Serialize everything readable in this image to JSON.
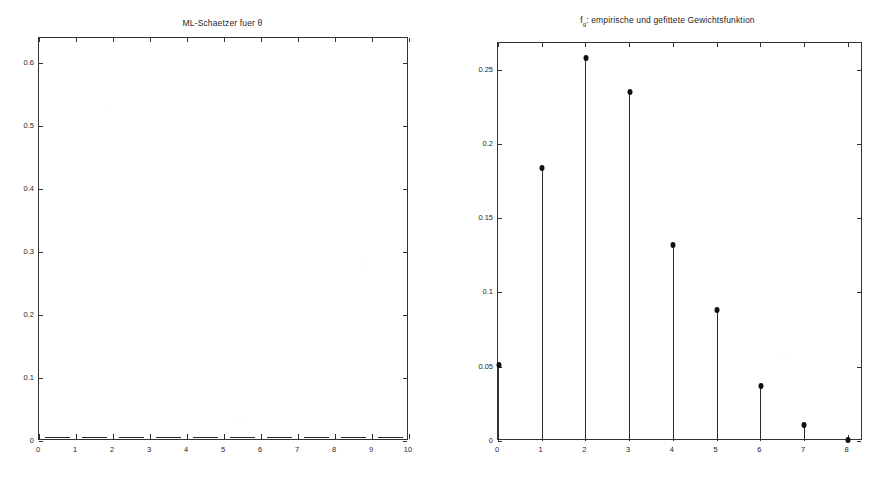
{
  "page": {
    "background_color": "#ffffff",
    "ink_color": "#1f1f1f",
    "axis_color": "#333333"
  },
  "charts": [
    {
      "id": "ml-estimator",
      "title_main": "ML-Schaetzer fuer ",
      "title_symbol": "θ",
      "title_full": "ML-Schaetzer fuer θ"
    },
    {
      "id": "weight-function",
      "title_prefix": "f",
      "title_subscript": "g",
      "title_rest": ": empirische und gefittete Gewichtsfunktion",
      "title_full": "f_g: empirische und gefittete Gewichtsfunktion"
    }
  ],
  "chart_data": [
    {
      "type": "line",
      "id": "ml-estimator",
      "title": "ML-Schaetzer fuer θ",
      "xlabel": "",
      "ylabel": "",
      "x": [
        0,
        1,
        2,
        3,
        4,
        5,
        6,
        7,
        8,
        9,
        10
      ],
      "values": [
        0,
        0,
        0,
        0,
        0,
        0,
        0,
        0,
        0,
        0,
        0
      ],
      "xlim": [
        0,
        10
      ],
      "ylim": [
        0,
        0.64
      ],
      "xticks": [
        0,
        1,
        2,
        3,
        4,
        5,
        6,
        7,
        8,
        9,
        10
      ],
      "xticklabels": [
        "0",
        "1",
        "2",
        "3",
        "4",
        "5",
        "6",
        "7",
        "8",
        "9",
        "10"
      ],
      "yticks": [
        0,
        0.1,
        0.2,
        0.3,
        0.4,
        0.5,
        0.6
      ],
      "yticklabels": [
        "0",
        "0.1",
        "0.2",
        "0.3",
        "0.4",
        "0.5",
        "0.6"
      ],
      "grid": false,
      "legend": null,
      "note": "curve lies flat on the x-axis at y = 0 across the whole range"
    },
    {
      "type": "scatter",
      "id": "weight-function",
      "title": "f_g: empirische und gefittete Gewichtsfunktion",
      "xlabel": "",
      "ylabel": "",
      "categories": [
        "0",
        "1",
        "2",
        "3",
        "4",
        "5",
        "6",
        "7",
        "8"
      ],
      "x": [
        0,
        1,
        2,
        3,
        4,
        5,
        6,
        7,
        8
      ],
      "values": [
        0.051,
        0.184,
        0.258,
        0.235,
        0.132,
        0.088,
        0.037,
        0.011,
        0.001
      ],
      "xlim": [
        0,
        8.35
      ],
      "ylim": [
        0,
        0.268
      ],
      "xticks": [
        0,
        1,
        2,
        3,
        4,
        5,
        6,
        7,
        8
      ],
      "xticklabels": [
        "0",
        "1",
        "2",
        "3",
        "4",
        "5",
        "6",
        "7",
        "8"
      ],
      "yticks": [
        0,
        0.05,
        0.1,
        0.15,
        0.2,
        0.25
      ],
      "yticklabels": [
        "0",
        "0.05",
        "0.1",
        "0.15",
        "0.2",
        "0.25"
      ],
      "grid": false,
      "legend": null,
      "marker": "filled-circle",
      "note": "stem plot: vertical lines from baseline to filled circular markers"
    }
  ]
}
